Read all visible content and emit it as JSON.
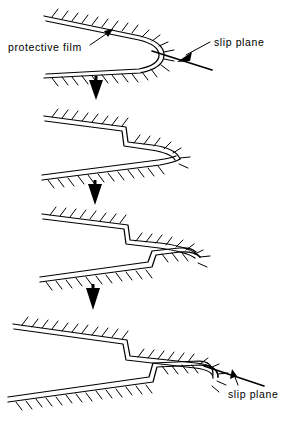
{
  "figure": {
    "stage_count": 4,
    "background_color": "#ffffff",
    "ink_color": "#000000"
  },
  "labels": {
    "protective_film": "protective  film",
    "slip_plane_top": "slip  plane",
    "slip_plane_bottom": "slip  plane"
  },
  "annotations": [
    {
      "name": "protective-film-callout",
      "text": "protective  film",
      "text_x": 8,
      "text_y": 49,
      "leader_from_x": 89,
      "leader_from_y": 44,
      "leader_to_x": 112,
      "leader_to_y": 30,
      "arrow_at": "end"
    },
    {
      "name": "slip-plane-callout-top",
      "text": "slip  plane",
      "text_x": 214,
      "text_y": 48,
      "leader_from_x": 209,
      "leader_from_y": 44,
      "leader_to_x": 176,
      "leader_to_y": 60,
      "arrow_at": "end"
    },
    {
      "name": "slip-plane-callout-bottom",
      "text": "slip  plane",
      "text_x": 228,
      "text_y": 393,
      "leader_from_x": 239,
      "leader_from_y": 384,
      "leader_to_x": 232,
      "leader_to_y": 370,
      "arrow_at": "end"
    }
  ],
  "progression_arrows": [
    {
      "name": "progression-arrow-1",
      "x": 96,
      "y_top": 80,
      "y_tip": 100
    },
    {
      "name": "progression-arrow-2",
      "x": 95,
      "y_top": 184,
      "y_tip": 205
    },
    {
      "name": "progression-arrow-3",
      "x": 93,
      "y_top": 288,
      "y_tip": 310
    }
  ],
  "stages": [
    {
      "name": "stage-1",
      "caption_state": "sharp notch, film intact, single slip plane emerging at tip",
      "upper_path": "M 45 18 L 140 38 Q 162 44 162 55 Q 162 66 140 71 L 45 76",
      "lower_path": "M 45 76 L 140 71",
      "slip_plane": {
        "x1": 152,
        "y1": 52,
        "x2": 210,
        "y2": 70
      },
      "tip_x": 162,
      "tip_y": 55
    },
    {
      "name": "stage-2",
      "caption_state": "one slip step formed on upper surface, tip advanced",
      "upper_path": "M 45 118 L 128 129 L 130 142 L 152 146 Q 172 150 176 158",
      "lower_path": "M 45 178 L 158 164 Q 172 161 176 158",
      "tip_x": 176,
      "tip_y": 158
    },
    {
      "name": "stage-3",
      "caption_state": "slip steps on both surfaces, crack deeper",
      "upper_path": "M 45 216 L 130 226 L 132 240 L 160 244 Q 188 248 196 256",
      "lower_path": "M 45 280 L 152 266 L 156 256 L 178 252 Q 190 251 196 256",
      "tip_x": 196,
      "tip_y": 256
    },
    {
      "name": "stage-4",
      "caption_state": "multiple slip steps, blunted crack tip, active slip plane at tip",
      "upper_path": "M 15 326 L 128 341 L 131 356 L 196 364 Q 216 366 216 376",
      "lower_path": "M 10 400 L 154 381 L 158 368 L 200 366 Q 216 366 216 376",
      "slip_plane": {
        "x1": 206,
        "y1": 368,
        "x2": 262,
        "y2": 385
      },
      "tip_x": 216,
      "tip_y": 376
    }
  ],
  "style_notes": {
    "hatch_tick_length": 9,
    "film_double_line_offset": 3,
    "line_color": "#000000",
    "font_size_px": 10.5
  }
}
